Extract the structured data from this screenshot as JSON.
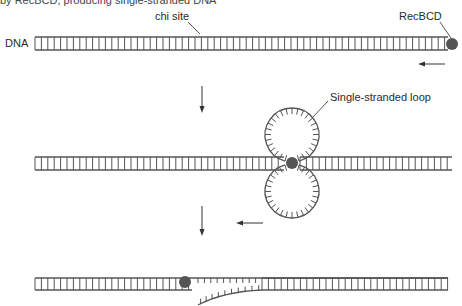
{
  "figure": {
    "cropped_caption": "by RecBCD, producing single-stranded DNA",
    "labels": {
      "dna": "DNA",
      "chi_site": "chi site",
      "recbcd": "RecBCD",
      "single_stranded_loop": "Single-stranded loop"
    },
    "stages": [
      {
        "id": "stage-1",
        "description": "RecBCD binds DNA end and moves left along duplex"
      },
      {
        "id": "stage-2",
        "description": "RecBCD unwinds DNA, forming single-stranded loops"
      },
      {
        "id": "stage-3",
        "description": "At chi site, single-stranded tail is released"
      }
    ],
    "colors": {
      "strand": "#555555",
      "protein": "#555555",
      "text": "#2a2a2a",
      "background": "#ffffff"
    }
  }
}
